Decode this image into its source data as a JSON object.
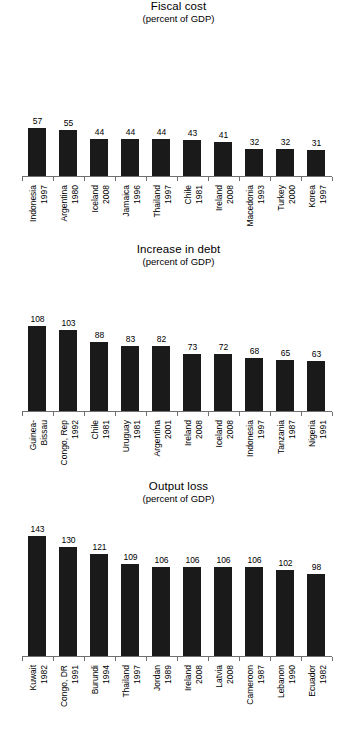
{
  "chart_data": [
    {
      "type": "bar",
      "title": "Fiscal cost",
      "subtitle": "(percent of GDP)",
      "xlabel": "",
      "ylabel": "percent of GDP",
      "ylim": [
        0,
        150
      ],
      "grid": false,
      "legend": false,
      "bar_color": "#1a1a1a",
      "categories": [
        "Indonesia 1997",
        "Argentina 1980",
        "Iceland 2008",
        "Jamaica 1996",
        "Thailand 1997",
        "Chile 1981",
        "Ireland 2008",
        "Macedonia 1993",
        "Turkey 2000",
        "Korea 1997"
      ],
      "tick_labels": [
        {
          "name": "Indonesia",
          "name2": "",
          "year": "1997"
        },
        {
          "name": "Argentina",
          "name2": "",
          "year": "1980"
        },
        {
          "name": "Iceland",
          "name2": "",
          "year": "2008"
        },
        {
          "name": "Jamaica",
          "name2": "",
          "year": "1996"
        },
        {
          "name": "Thailand",
          "name2": "",
          "year": "1997"
        },
        {
          "name": "Chile",
          "name2": "",
          "year": "1981"
        },
        {
          "name": "Ireland",
          "name2": "",
          "year": "2008"
        },
        {
          "name": "Macedonia",
          "name2": "",
          "year": "1993"
        },
        {
          "name": "Turkey",
          "name2": "",
          "year": "2000"
        },
        {
          "name": "Korea",
          "name2": "",
          "year": "1997"
        }
      ],
      "values": [
        57,
        55,
        44,
        44,
        44,
        43,
        41,
        32,
        32,
        31
      ]
    },
    {
      "type": "bar",
      "title": "Increase in debt",
      "subtitle": "(percent of GDP)",
      "xlabel": "",
      "ylabel": "percent of GDP",
      "ylim": [
        0,
        150
      ],
      "grid": false,
      "legend": false,
      "bar_color": "#1a1a1a",
      "categories": [
        "Guinea-Bissau 1992",
        "Congo, Rep 1992",
        "Chile 1981",
        "Uruguay 1981",
        "Argentina 2001",
        "Ireland 2008",
        "Iceland 2008",
        "Indonesia 1997",
        "Tanzania 1987",
        "Nigeria 1991"
      ],
      "tick_labels": [
        {
          "name": "Guinea-",
          "name2": "Bissau",
          "year": ""
        },
        {
          "name": "Congo, Rep",
          "name2": "",
          "year": "1992"
        },
        {
          "name": "Chile",
          "name2": "",
          "year": "1981"
        },
        {
          "name": "Uruguay",
          "name2": "",
          "year": "1981"
        },
        {
          "name": "Argentina",
          "name2": "",
          "year": "2001"
        },
        {
          "name": "Ireland",
          "name2": "",
          "year": "2008"
        },
        {
          "name": "Iceland",
          "name2": "",
          "year": "2008"
        },
        {
          "name": "Indonesia",
          "name2": "",
          "year": "1997"
        },
        {
          "name": "Tanzania",
          "name2": "",
          "year": "1987"
        },
        {
          "name": "Nigeria",
          "name2": "",
          "year": "1991"
        }
      ],
      "values": [
        108,
        103,
        88,
        83,
        82,
        73,
        72,
        68,
        65,
        63
      ]
    },
    {
      "type": "bar",
      "title": "Output loss",
      "subtitle": "(percent of GDP)",
      "xlabel": "",
      "ylabel": "percent of GDP",
      "ylim": [
        0,
        150
      ],
      "grid": false,
      "legend": false,
      "bar_color": "#1a1a1a",
      "categories": [
        "Kuwait 1982",
        "Congo, DR 1991",
        "Burundi 1994",
        "Thailand 1997",
        "Jordan 1989",
        "Ireland 2008",
        "Latvia 2008",
        "Cameroon 1987",
        "Lebanon 1990",
        "Ecuador 1982"
      ],
      "tick_labels": [
        {
          "name": "Kuwait",
          "name2": "",
          "year": "1982"
        },
        {
          "name": "Congo, DR",
          "name2": "",
          "year": "1991"
        },
        {
          "name": "Burundi",
          "name2": "",
          "year": "1994"
        },
        {
          "name": "Thailand",
          "name2": "",
          "year": "1997"
        },
        {
          "name": "Jordan",
          "name2": "",
          "year": "1989"
        },
        {
          "name": "Ireland",
          "name2": "",
          "year": "2008"
        },
        {
          "name": "Latvia",
          "name2": "",
          "year": "2008"
        },
        {
          "name": "Cameroon",
          "name2": "",
          "year": "1987"
        },
        {
          "name": "Lebanon",
          "name2": "",
          "year": "1990"
        },
        {
          "name": "Ecuador",
          "name2": "",
          "year": "1982"
        }
      ],
      "values": [
        143,
        130,
        121,
        109,
        106,
        106,
        106,
        106,
        102,
        98
      ]
    }
  ]
}
